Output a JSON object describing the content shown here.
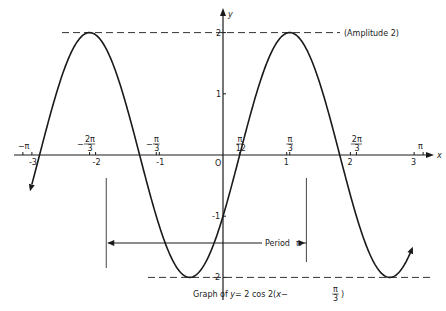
{
  "chart_data": {
    "type": "line",
    "caption": {
      "prefix": "Graph of ",
      "var": "y",
      "body": "= 2 cos 2(",
      "xvar": "x",
      "minus": "−",
      "frac_num": "π",
      "frac_den": "3",
      "close": ")"
    },
    "function": "2*cos(2*(x - pi/3))",
    "xlabel": "x",
    "ylabel": "y",
    "xlim": [
      -3.25,
      3.3
    ],
    "ylim": [
      -2.2,
      2.4
    ],
    "x_ticks": [
      {
        "value": -3,
        "label": "-3"
      },
      {
        "value": -2,
        "label": "-2"
      },
      {
        "value": -1,
        "label": "-1"
      },
      {
        "value": 1,
        "label": "1"
      },
      {
        "value": 2,
        "label": "2"
      },
      {
        "value": 3,
        "label": "3"
      }
    ],
    "x_special_ticks": [
      {
        "value": -3.1416,
        "num": "−π",
        "den": ""
      },
      {
        "value": -2.0944,
        "num": "2π",
        "den": "3",
        "sign": "−"
      },
      {
        "value": -1.0472,
        "num": "π",
        "den": "3",
        "sign": "−"
      },
      {
        "value": 0.2618,
        "num": "π",
        "den": "12",
        "sign": ""
      },
      {
        "value": 1.0472,
        "num": "π",
        "den": "3",
        "sign": ""
      },
      {
        "value": 2.0944,
        "num": "2π",
        "den": "3",
        "sign": ""
      },
      {
        "value": 3.1416,
        "num": "π",
        "den": "",
        "sign": ""
      }
    ],
    "y_ticks": [
      {
        "value": 2,
        "label": "2"
      },
      {
        "value": 1,
        "label": "1"
      },
      {
        "value": -1,
        "label": "-1"
      },
      {
        "value": -2,
        "label": "-2"
      }
    ],
    "origin_label": "O",
    "annotations": {
      "amplitude": "(Amplitude 2)",
      "period_label": "Period",
      "period_symbol": "π",
      "period_from": -1.8326,
      "period_to": 1.309
    },
    "key_points": {
      "maxima": [
        [
          -2.0944,
          2
        ],
        [
          1.0472,
          2
        ]
      ],
      "minima": [
        [
          -0.5236,
          -2
        ],
        [
          2.618,
          -2
        ]
      ],
      "zeros": [
        [
          -2.8798,
          0
        ],
        [
          -1.309,
          0
        ],
        [
          0.2618,
          0
        ],
        [
          1.8326,
          0
        ]
      ]
    },
    "grid": false,
    "legend": null
  }
}
